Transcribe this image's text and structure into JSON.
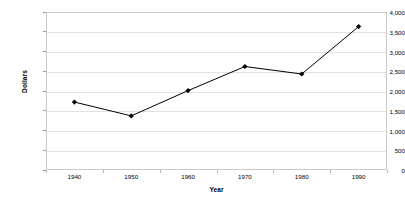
{
  "chart_data": {
    "type": "line",
    "title": "",
    "xlabel": "Year",
    "ylabel": "Dollars",
    "categories": [
      "1940",
      "1950",
      "1960",
      "1970",
      "1980",
      "1990"
    ],
    "values": [
      1720,
      1370,
      2010,
      2620,
      2430,
      3630
    ],
    "series": [
      {
        "name": "Dollars",
        "values": [
          1720,
          1370,
          2010,
          2620,
          2430,
          3630
        ]
      }
    ],
    "ylim": [
      0,
      4000
    ],
    "ytick_values": [
      0,
      500,
      1000,
      1500,
      2000,
      2500,
      3000,
      3500,
      4000
    ],
    "ytick_labels": [
      "0",
      "500",
      "1,000",
      "1,500",
      "2,000",
      "2,500",
      "3,000",
      "3,500",
      "4,000"
    ],
    "xtick_labels": [
      "1940",
      "1950",
      "1960",
      "1970",
      "1980",
      "1990"
    ],
    "grid": "horizontal",
    "legend": "none",
    "marker": "diamond",
    "line_color": "#000000",
    "marker_color": "#000000",
    "gridline_color": "#e2e2e2",
    "plot_border_color": "#c9c9c9",
    "background_color": "#ffffff"
  }
}
